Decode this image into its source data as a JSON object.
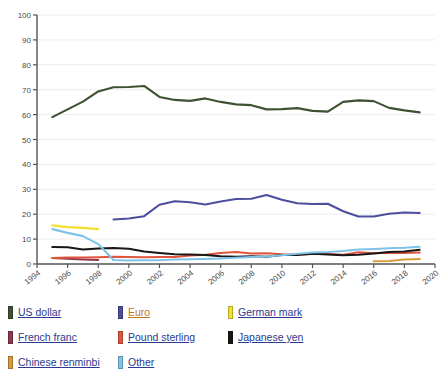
{
  "chart_data": {
    "type": "line",
    "title": "",
    "xlabel": "",
    "ylabel": "",
    "xlim": [
      1994,
      2020
    ],
    "ylim": [
      0,
      100
    ],
    "grid": true,
    "legend_position": "bottom",
    "y_ticks": [
      0,
      10,
      20,
      30,
      40,
      50,
      60,
      70,
      80,
      90,
      100
    ],
    "x_ticks": [
      1994,
      1996,
      1998,
      2000,
      2002,
      2004,
      2006,
      2008,
      2010,
      2012,
      2014,
      2016,
      2018,
      2020
    ],
    "x": [
      1995,
      1996,
      1997,
      1998,
      1999,
      2000,
      2001,
      2002,
      2003,
      2004,
      2005,
      2006,
      2007,
      2008,
      2009,
      2010,
      2011,
      2012,
      2013,
      2014,
      2015,
      2016,
      2017,
      2018,
      2019
    ],
    "series": [
      {
        "name": "US dollar",
        "color": "#3c5232",
        "x": [
          1995,
          1996,
          1997,
          1998,
          1999,
          2000,
          2001,
          2002,
          2003,
          2004,
          2005,
          2006,
          2007,
          2008,
          2009,
          2010,
          2011,
          2012,
          2013,
          2014,
          2015,
          2016,
          2017,
          2018,
          2019
        ],
        "values": [
          59.0,
          62.1,
          65.2,
          69.3,
          71.0,
          71.1,
          71.5,
          67.1,
          65.9,
          65.5,
          66.5,
          65.1,
          64.1,
          63.8,
          62.1,
          62.2,
          62.6,
          61.5,
          61.2,
          65.1,
          65.7,
          65.4,
          62.7,
          61.7,
          60.9
        ]
      },
      {
        "name": "Euro",
        "color": "#4b4f9e",
        "x": [
          1999,
          2000,
          2001,
          2002,
          2003,
          2004,
          2005,
          2006,
          2007,
          2008,
          2009,
          2010,
          2011,
          2012,
          2013,
          2014,
          2015,
          2016,
          2017,
          2018,
          2019
        ],
        "values": [
          17.9,
          18.3,
          19.2,
          23.8,
          25.2,
          24.8,
          23.9,
          25.1,
          26.1,
          26.2,
          27.7,
          25.8,
          24.4,
          24.1,
          24.2,
          21.2,
          19.1,
          19.1,
          20.2,
          20.7,
          20.5
        ]
      },
      {
        "name": "German mark",
        "color": "#f2e02e",
        "x": [
          1995,
          1996,
          1997,
          1998
        ],
        "values": [
          15.5,
          14.8,
          14.5,
          14.0
        ]
      },
      {
        "name": "French franc",
        "color": "#8e3a4e",
        "x": [
          1995,
          1996,
          1997,
          1998
        ],
        "values": [
          2.4,
          2.1,
          1.8,
          1.6
        ]
      },
      {
        "name": "Pound sterling",
        "color": "#e0553c",
        "x": [
          1995,
          1996,
          1997,
          1998,
          1999,
          2000,
          2001,
          2002,
          2003,
          2004,
          2005,
          2006,
          2007,
          2008,
          2009,
          2010,
          2011,
          2012,
          2013,
          2014,
          2015,
          2016,
          2017,
          2018,
          2019
        ],
        "values": [
          2.4,
          2.6,
          2.6,
          2.7,
          2.9,
          2.8,
          2.7,
          2.8,
          2.8,
          3.4,
          3.7,
          4.4,
          4.8,
          4.2,
          4.3,
          3.9,
          3.8,
          4.0,
          4.0,
          3.7,
          4.7,
          4.3,
          4.5,
          4.4,
          4.6
        ]
      },
      {
        "name": "Japanese yen",
        "color": "#171717",
        "x": [
          1995,
          1996,
          1997,
          1998,
          1999,
          2000,
          2001,
          2002,
          2003,
          2004,
          2005,
          2006,
          2007,
          2008,
          2009,
          2010,
          2011,
          2012,
          2013,
          2014,
          2015,
          2016,
          2017,
          2018,
          2019
        ],
        "values": [
          6.8,
          6.7,
          5.8,
          6.2,
          6.4,
          6.1,
          5.0,
          4.4,
          3.9,
          3.8,
          3.6,
          3.1,
          2.9,
          3.1,
          2.9,
          3.6,
          3.6,
          4.1,
          3.8,
          3.5,
          3.7,
          4.2,
          4.8,
          5.0,
          5.7
        ]
      },
      {
        "name": "Chinese renminbi",
        "color": "#d99a3c",
        "x": [
          2016,
          2017,
          2018,
          2019
        ],
        "values": [
          1.1,
          1.2,
          1.8,
          2.0
        ]
      },
      {
        "name": "Other",
        "color": "#7fc4e8",
        "x": [
          1995,
          1996,
          1997,
          1998,
          1999,
          2000,
          2001,
          2002,
          2003,
          2004,
          2005,
          2006,
          2007,
          2008,
          2009,
          2010,
          2011,
          2012,
          2013,
          2014,
          2015,
          2016,
          2017,
          2018,
          2019
        ],
        "values": [
          14.0,
          12.5,
          11.2,
          8.0,
          1.6,
          1.4,
          1.5,
          1.5,
          1.8,
          1.9,
          2.0,
          2.2,
          2.5,
          2.8,
          3.0,
          3.5,
          4.1,
          4.6,
          4.8,
          5.2,
          5.8,
          6.0,
          6.3,
          6.5,
          6.9
        ]
      }
    ]
  },
  "legend": {
    "items": [
      {
        "label": "US dollar",
        "color": "#3c5232",
        "visited": false
      },
      {
        "label": "Euro",
        "color": "#4b4f9e",
        "visited": true
      },
      {
        "label": "German mark",
        "color": "#f2e02e",
        "visited": false
      },
      {
        "label": "French franc",
        "color": "#8e3a4e",
        "visited": false
      },
      {
        "label": "Pound sterling",
        "color": "#e0553c",
        "visited": false
      },
      {
        "label": "Japanese yen",
        "color": "#171717",
        "visited": false
      },
      {
        "label": "Chinese renminbi",
        "color": "#d99a3c",
        "visited": false
      },
      {
        "label": "Other",
        "color": "#7fc4e8",
        "visited": false
      }
    ]
  }
}
